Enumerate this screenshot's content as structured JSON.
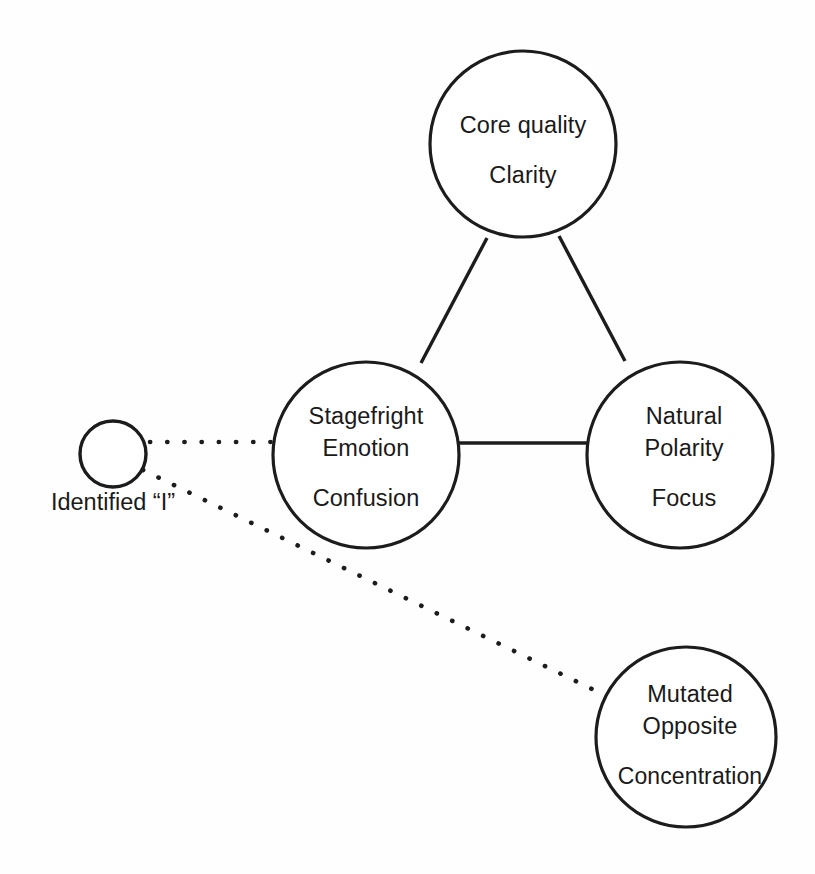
{
  "diagram": {
    "background_color": "#fefefe",
    "stroke_color": "#1c1c1c",
    "text_color": "#1a1a1a",
    "nodes": [
      {
        "id": "core-quality",
        "lines": [
          "Core quality",
          "Clarity"
        ],
        "line1": "Core quality",
        "line2": "Clarity",
        "cx": 523,
        "cy": 144,
        "r": 93
      },
      {
        "id": "stagefright",
        "lines": [
          "Stagefright",
          "Emotion",
          "Confusion"
        ],
        "line1": "Stagefright",
        "line2": "Emotion",
        "line3": "Confusion",
        "cx": 366,
        "cy": 455,
        "r": 93
      },
      {
        "id": "natural-polarity",
        "lines": [
          "Natural",
          "Polarity",
          "Focus"
        ],
        "line1": "Natural",
        "line2": "Polarity",
        "line3": "Focus",
        "cx": 680,
        "cy": 455,
        "r": 93
      },
      {
        "id": "mutated-opposite",
        "lines": [
          "Mutated",
          "Opposite",
          "Concentration"
        ],
        "line1": "Mutated",
        "line2": "Opposite",
        "line3": "Concentration",
        "cx": 686,
        "cy": 737,
        "r": 90
      },
      {
        "id": "identified-i",
        "lines": [],
        "caption": "Identified “I”",
        "cx": 113,
        "cy": 454,
        "r": 33
      }
    ],
    "edges": [
      {
        "id": "core-to-stagefright",
        "style": "solid",
        "from": "core-quality",
        "to": "stagefright"
      },
      {
        "id": "core-to-natural",
        "style": "solid",
        "from": "core-quality",
        "to": "natural-polarity"
      },
      {
        "id": "stagefright-to-natural",
        "style": "solid",
        "from": "stagefright",
        "to": "natural-polarity"
      },
      {
        "id": "identified-to-stagefright",
        "style": "dotted",
        "from": "identified-i",
        "to": "stagefright"
      },
      {
        "id": "identified-to-mutated",
        "style": "dotted",
        "from": "identified-i",
        "to": "mutated-opposite"
      }
    ]
  }
}
